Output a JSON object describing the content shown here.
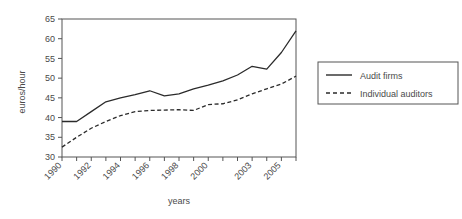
{
  "chart_data": {
    "type": "line",
    "title": "",
    "xlabel": "years",
    "ylabel": "euros/hour",
    "xlim": [
      1990,
      2006
    ],
    "ylim": [
      30,
      65
    ],
    "yticks": [
      30,
      35,
      40,
      45,
      50,
      55,
      60,
      65
    ],
    "xticks": [
      1990,
      1991,
      1992,
      1993,
      1994,
      1995,
      1996,
      1997,
      1998,
      1999,
      2000,
      2001,
      2002,
      2003,
      2004,
      2005,
      2006
    ],
    "xtick_labels": [
      "1990",
      "",
      "1992",
      "",
      "1994",
      "",
      "1996",
      "",
      "1998",
      "",
      "2000",
      "",
      "",
      "2003",
      "",
      "2005",
      ""
    ],
    "grid": false,
    "legend_position": "right",
    "x": [
      1990,
      1991,
      1992,
      1993,
      1994,
      1995,
      1996,
      1997,
      1998,
      1999,
      2000,
      2001,
      2002,
      2003,
      2004,
      2005,
      2006
    ],
    "series": [
      {
        "name": "Audit firms",
        "style": "solid",
        "color": "#2b2b2b",
        "values": [
          39.0,
          39.0,
          41.5,
          44.0,
          45.0,
          45.8,
          46.8,
          45.5,
          46.0,
          47.3,
          48.2,
          49.3,
          50.8,
          53.0,
          52.3,
          56.5,
          62.0
        ]
      },
      {
        "name": "Individual auditors",
        "style": "dashed",
        "color": "#2b2b2b",
        "values": [
          32.5,
          35.0,
          37.3,
          39.0,
          40.5,
          41.5,
          41.8,
          41.9,
          42.0,
          41.8,
          43.3,
          43.5,
          44.5,
          46.0,
          47.3,
          48.5,
          50.5
        ]
      }
    ]
  },
  "legend": {
    "items": [
      {
        "label": "Audit firms",
        "style": "solid"
      },
      {
        "label": "Individual auditors",
        "style": "dashed"
      }
    ]
  },
  "axes": {
    "ylabel": "euros/hour",
    "xlabel": "years"
  }
}
